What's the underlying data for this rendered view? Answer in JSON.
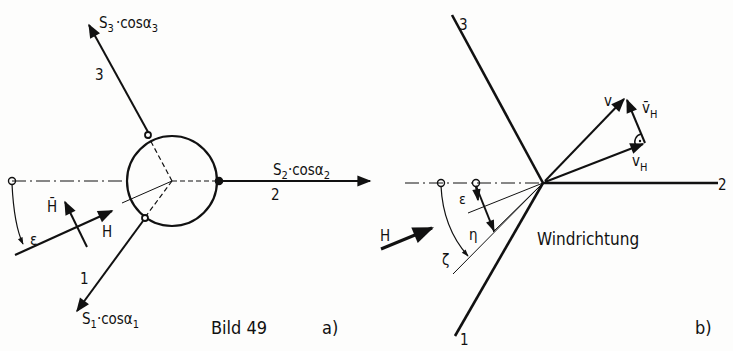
{
  "figure": {
    "caption": "Bild 49",
    "panel_a": {
      "tag": "a)",
      "vectors": [
        {
          "id": "1",
          "index_label": "1",
          "force_label_main": "S",
          "force_sub": "1",
          "force_label_tail": "·cosα",
          "force_sub2": "1"
        },
        {
          "id": "2",
          "index_label": "2",
          "force_label_main": "S",
          "force_sub": "2",
          "force_label_tail": "·cosα",
          "force_sub2": "2"
        },
        {
          "id": "3",
          "index_label": "3",
          "force_label_main": "S",
          "force_sub": "3",
          "force_label_tail": "·cosα",
          "force_sub2": "3"
        }
      ],
      "symbols": {
        "epsilon": "ε",
        "H": "H",
        "H_bar": "H̄"
      }
    },
    "panel_b": {
      "tag": "b)",
      "lines": [
        "1",
        "2",
        "3"
      ],
      "symbols": {
        "v": "v",
        "v_H": "v",
        "v_H_sub": "H",
        "v_H_bar": "v̄",
        "v_H_bar_sub": "H",
        "epsilon": "ε",
        "eta": "η",
        "zeta": "ζ",
        "H": "H"
      },
      "annotation": "Windrichtung"
    }
  },
  "colors": {
    "ink": "#111111",
    "paper": "#fdfdfc"
  }
}
